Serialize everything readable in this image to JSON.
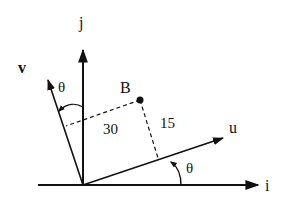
{
  "diagram": {
    "axes": {
      "i_label": "i",
      "j_label": "j"
    },
    "vectors": {
      "u_label": "u",
      "v_label": "v"
    },
    "point": {
      "label": "B",
      "distance_along_v_perp": "30",
      "distance_along_u_perp": "15"
    },
    "angles": {
      "theta_u": "θ",
      "theta_v": "θ"
    },
    "colors": {
      "line": "#111111",
      "background": "#ffffff"
    }
  }
}
